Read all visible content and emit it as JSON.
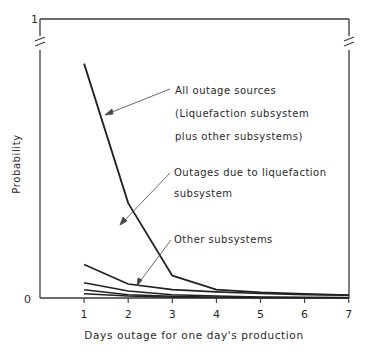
{
  "chart_data": {
    "type": "line",
    "title": "",
    "xlabel": "Days outage for one day's production",
    "ylabel": "Probability",
    "x": [
      1,
      2,
      3,
      4,
      5,
      6,
      7
    ],
    "xticks": [
      "1",
      "2",
      "3",
      "4",
      "5",
      "6",
      "7"
    ],
    "yticks": [
      "0",
      "1"
    ],
    "ylim": [
      0,
      1
    ],
    "xlim": [
      0,
      7
    ],
    "grid": false,
    "axis_break": true,
    "series": [
      {
        "name": "All outage sources (Liquefaction subsystem plus other subsystems)",
        "values": [
          0.84,
          0.34,
          0.08,
          0.03,
          0.02,
          0.015,
          0.01
        ]
      },
      {
        "name": "Outages due to liquefaction subsystem",
        "values": [
          0.12,
          0.05,
          0.03,
          0.022,
          0.016,
          0.012,
          0.01
        ]
      },
      {
        "name": "Other subsystems (a)",
        "values": [
          0.055,
          0.025,
          0.012,
          0.007,
          0.004,
          0.003,
          0.002
        ]
      },
      {
        "name": "Other subsystems (b)",
        "values": [
          0.03,
          0.012,
          0.006,
          0.003,
          0.002,
          0.001,
          0.001
        ]
      },
      {
        "name": "Other subsystems (c)",
        "values": [
          0.015,
          0.007,
          0.003,
          0.002,
          0.001,
          0.001,
          0.001
        ]
      }
    ],
    "annotations": [
      {
        "lines": [
          "All outage sources",
          "(Liquefaction subsystem",
          "plus other subsystems)"
        ]
      },
      {
        "lines": [
          "Outages due to liquefaction",
          "subsystem"
        ]
      },
      {
        "lines": [
          "Other subsystems"
        ]
      }
    ]
  }
}
